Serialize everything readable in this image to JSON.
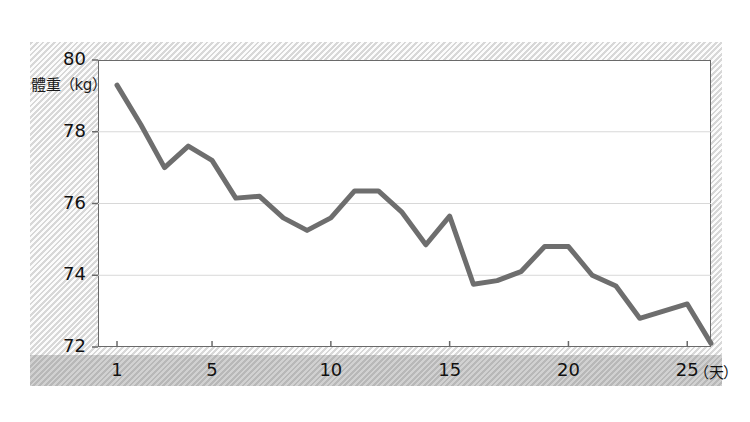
{
  "chart_data": {
    "type": "line",
    "title": "",
    "subtitle": "",
    "xlabel": "（天）",
    "ylabel": "體重（kg）",
    "x": [
      1,
      2,
      3,
      4,
      5,
      6,
      7,
      8,
      9,
      10,
      11,
      12,
      13,
      14,
      15,
      16,
      17,
      18,
      19,
      20,
      21,
      22,
      23,
      24,
      25,
      26
    ],
    "values": [
      79.3,
      78.2,
      77.0,
      77.6,
      77.2,
      76.15,
      76.2,
      75.6,
      75.25,
      75.6,
      76.35,
      76.35,
      75.75,
      74.85,
      75.65,
      73.75,
      73.85,
      74.1,
      74.8,
      74.8,
      74.0,
      73.7,
      72.8,
      73.0,
      73.2,
      72.1
    ],
    "series": [
      {
        "name": "體重",
        "values": [
          79.3,
          78.2,
          77.0,
          77.6,
          77.2,
          76.15,
          76.2,
          75.6,
          75.25,
          75.6,
          76.35,
          76.35,
          75.75,
          74.85,
          75.65,
          73.75,
          73.85,
          74.1,
          74.8,
          74.8,
          74.0,
          73.7,
          72.8,
          73.0,
          73.2,
          72.1
        ],
        "color": "#6e6e6e"
      }
    ],
    "xlim": [
      0.2,
      26.0
    ],
    "ylim": [
      72,
      80
    ],
    "xticks": [
      1,
      5,
      10,
      15,
      20,
      25
    ],
    "xtick_labels": [
      "1",
      "5",
      "10",
      "15",
      "20",
      "25"
    ],
    "yticks": [
      72,
      74,
      76,
      78,
      80
    ],
    "ytick_labels": [
      "72",
      "74",
      "76",
      "78",
      "80"
    ],
    "grid": true,
    "grid_axis": "y",
    "grid_color": "#d8d8d8",
    "legend": false,
    "legend_position": "none",
    "line_color": "#6e6e6e",
    "line_width": 5,
    "markers": false,
    "annotations": []
  },
  "axes": {
    "y_label": "體重（kg）",
    "y_ticks": [
      "80",
      "78",
      "76",
      "74",
      "72"
    ],
    "x_ticks": [
      "1",
      "5",
      "10",
      "15",
      "20",
      "25"
    ],
    "x_unit": "（天）"
  },
  "colors": {
    "line": "#6e6e6e",
    "plot_background": "#ffffff",
    "panel_background": "#e9e9e9",
    "band_background": "#bdbdbd",
    "grid": "#d8d8d8",
    "axis": "#6a6a6a",
    "text": "#111111"
  }
}
